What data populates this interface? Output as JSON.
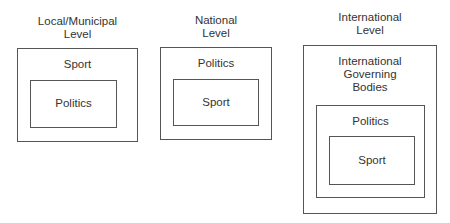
{
  "diagram": {
    "type": "nested-boxes",
    "columns": [
      {
        "title_line1": "Local/Municipal",
        "title_line2": "Level",
        "outer": "Sport",
        "inner": "Politics"
      },
      {
        "title_line1": "National",
        "title_line2": "Level",
        "outer": "Politics",
        "inner": "Sport"
      },
      {
        "title_line1": "International",
        "title_line2": "Level",
        "outer_line1": "International",
        "outer_line2": "Governing",
        "outer_line3": "Bodies",
        "middle": "Politics",
        "inner": "Sport"
      }
    ],
    "colors": {
      "line": "#555555",
      "text": "#333333",
      "background": "#ffffff"
    }
  }
}
